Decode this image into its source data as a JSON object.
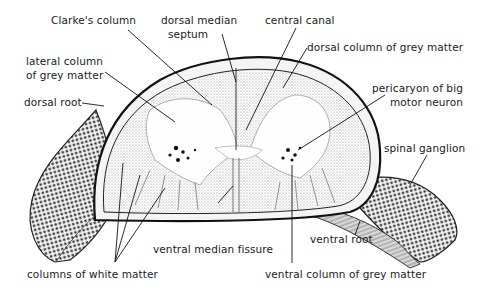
{
  "figure": {
    "labels": {
      "clarkes_column": "Clarke's column",
      "dorsal_median_septum_1": "dorsal median",
      "dorsal_median_septum_2": "septum",
      "central_canal": "central canal",
      "dorsal_column_grey": "dorsal column of grey matter",
      "lateral_column_1": "lateral column",
      "lateral_column_2": "of grey matter",
      "pericaryon_1": "pericaryon of big",
      "pericaryon_2": "motor neuron",
      "dorsal_root": "dorsal root",
      "spinal_ganglion": "spinal ganglion",
      "ventral_root": "ventral root",
      "ventral_median_fissure": "ventral median fissure",
      "columns_white_matter": "columns of white matter",
      "ventral_column_grey": "ventral column of grey matter"
    },
    "colors": {
      "ink": "#1a1a1a",
      "paper": "#ffffff",
      "stipple": "#bdbdbd"
    }
  }
}
